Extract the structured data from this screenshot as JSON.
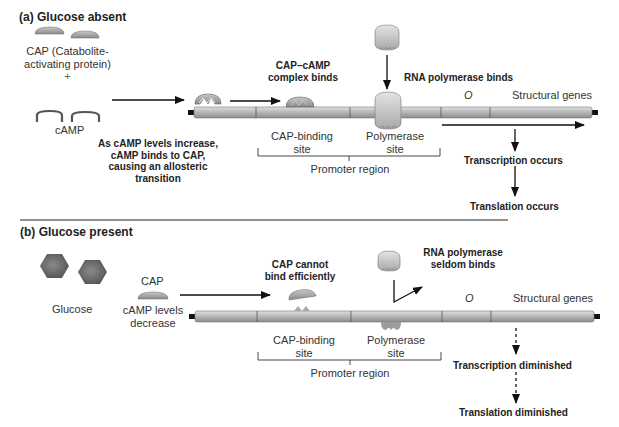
{
  "panel_a": {
    "heading": "(a) Glucose absent",
    "cap_label_line1": "CAP (Catabolite-",
    "cap_label_line2": "activating protein)",
    "plus": "+",
    "camp_label": "cAMP",
    "allosteric_note": [
      "As cAMP levels increase,",
      "cAMP binds to CAP,",
      "causing an allosteric",
      "transition"
    ],
    "complex_binds": [
      "CAP–cAMP",
      "complex binds"
    ],
    "rna_pol_binds": "RNA polymerase binds",
    "operator_label": "O",
    "structural_genes": "Structural genes",
    "cap_binding_site": [
      "CAP-binding",
      "site"
    ],
    "polymerase_site": [
      "Polymerase",
      "site"
    ],
    "promoter_region": "Promoter region",
    "transcription": "Transcription occurs",
    "translation": "Translation occurs"
  },
  "panel_b": {
    "heading": "(b) Glucose present",
    "glucose_label": "Glucose",
    "cap_label": "CAP",
    "camp_decrease": [
      "cAMP levels",
      "decrease"
    ],
    "cap_cannot_bind": [
      "CAP cannot",
      "bind efficiently"
    ],
    "rna_pol_seldom": [
      "RNA polymerase",
      "seldom binds"
    ],
    "operator_label": "O",
    "structural_genes": "Structural genes",
    "cap_binding_site": [
      "CAP-binding",
      "site"
    ],
    "polymerase_site": [
      "Polymerase",
      "site"
    ],
    "promoter_region": "Promoter region",
    "transcription": "Transcription diminished",
    "translation": "Translation diminished"
  },
  "colors": {
    "protein_gray": "#9a9a9a",
    "dna_gray": "#b5b5b5",
    "glucose_gray": "#6e6e6e",
    "arrow": "#111111"
  }
}
